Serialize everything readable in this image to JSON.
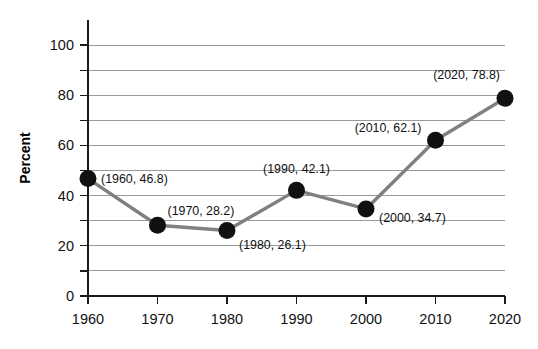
{
  "chart_data": {
    "type": "line",
    "title": "",
    "xlabel": "",
    "ylabel": "Percent",
    "x": [
      1960,
      1970,
      1980,
      1990,
      2000,
      2010,
      2020
    ],
    "values": [
      46.8,
      28.2,
      26.1,
      42.1,
      34.7,
      62.1,
      78.8
    ],
    "categories": [
      "1960",
      "1970",
      "1980",
      "1990",
      "2000",
      "2010",
      "2020"
    ],
    "xlim": [
      1960,
      2020
    ],
    "ylim": [
      0,
      110
    ],
    "y_major_ticks": [
      0,
      20,
      40,
      60,
      80,
      100
    ],
    "y_minor_ticks": [
      10,
      30,
      50,
      70,
      90
    ],
    "y_tick_labels": [
      "0",
      "20",
      "40",
      "60",
      "80",
      "100"
    ],
    "x_tick_labels": [
      "1960",
      "1970",
      "1980",
      "1990",
      "2000",
      "2010",
      "2020"
    ],
    "gridlines": "horizontal",
    "grid_values": [
      10,
      20,
      30,
      40,
      50,
      60,
      70,
      80,
      90,
      100
    ],
    "legend": "none",
    "point_labels": [
      "(1960, 46.8)",
      "(1970, 28.2)",
      "(1980, 26.1)",
      "(1990, 42.1)",
      "(2000, 34.7)",
      "(2010, 62.1)",
      "(2020, 78.8)"
    ],
    "colors": {
      "line": "#808080",
      "marker": "#111111",
      "axis": "#1a1a1a",
      "grid": "#9a9a9a",
      "background": "#ffffff",
      "text": "#111111"
    }
  },
  "layout": {
    "plot_left": 88,
    "plot_right": 505,
    "plot_top": 20,
    "plot_bottom": 296,
    "marker_radius": 8.5,
    "label_offsets": [
      {
        "dx": 13,
        "dy": 4,
        "anchor": "start"
      },
      {
        "dx": 10,
        "dy": -10,
        "anchor": "start"
      },
      {
        "dx": 12,
        "dy": 18,
        "anchor": "start"
      },
      {
        "dx": 0,
        "dy": -17,
        "anchor": "middle"
      },
      {
        "dx": 13,
        "dy": 13,
        "anchor": "start"
      },
      {
        "dx": -14,
        "dy": -8,
        "anchor": "end"
      },
      {
        "dx": -5,
        "dy": -19,
        "anchor": "end"
      }
    ]
  }
}
